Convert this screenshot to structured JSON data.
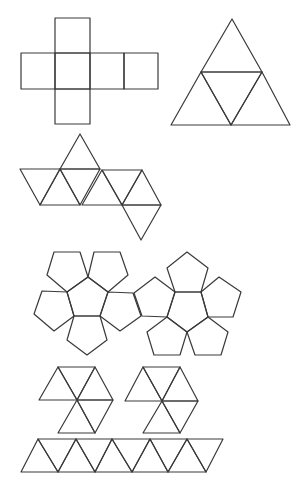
{
  "diagram": {
    "title": "",
    "stroke_color": "#3a3a3a",
    "background": "#ffffff",
    "nets": [
      {
        "id": "cube-net",
        "solid": "cube",
        "faces": 6,
        "polygons": [
          [
            [
              55,
              18
            ],
            [
              90,
              18
            ],
            [
              90,
              53
            ],
            [
              55,
              53
            ]
          ],
          [
            [
              21,
              53
            ],
            [
              55,
              53
            ],
            [
              55,
              89
            ],
            [
              21,
              89
            ]
          ],
          [
            [
              55,
              53
            ],
            [
              90,
              53
            ],
            [
              90,
              89
            ],
            [
              55,
              89
            ]
          ],
          [
            [
              90,
              53
            ],
            [
              124,
              53
            ],
            [
              124,
              89
            ],
            [
              90,
              89
            ]
          ],
          [
            [
              124,
              53
            ],
            [
              158,
              53
            ],
            [
              158,
              89
            ],
            [
              124,
              89
            ]
          ],
          [
            [
              55,
              89
            ],
            [
              90,
              89
            ],
            [
              90,
              124
            ],
            [
              55,
              124
            ]
          ]
        ]
      },
      {
        "id": "tetrahedron-net",
        "solid": "tetrahedron",
        "faces": 4,
        "polygons": [
          [
            [
              232,
              19
            ],
            [
              201,
              72
            ],
            [
              262,
              72
            ]
          ],
          [
            [
              201,
              72
            ],
            [
              171,
              125
            ],
            [
              231,
              125
            ]
          ],
          [
            [
              201,
              72
            ],
            [
              262,
              72
            ],
            [
              231,
              125
            ]
          ],
          [
            [
              262,
              72
            ],
            [
              231,
              125
            ],
            [
              290,
              125
            ]
          ]
        ]
      },
      {
        "id": "octahedron-net",
        "solid": "octahedron",
        "faces": 8,
        "polygons": [
          [
            [
              80,
              134
            ],
            [
              60,
              169
            ],
            [
              100,
              169
            ]
          ],
          [
            [
              20,
              169
            ],
            [
              60,
              169
            ],
            [
              40,
              205
            ]
          ],
          [
            [
              60,
              169
            ],
            [
              40,
              205
            ],
            [
              80,
              205
            ]
          ],
          [
            [
              60,
              169
            ],
            [
              100,
              169
            ],
            [
              80,
              205
            ]
          ],
          [
            [
              102,
              170
            ],
            [
              82,
              205
            ],
            [
              122,
              205
            ]
          ],
          [
            [
              102,
              170
            ],
            [
              142,
              170
            ],
            [
              122,
              205
            ]
          ],
          [
            [
              142,
              170
            ],
            [
              122,
              205
            ],
            [
              161,
              205
            ]
          ],
          [
            [
              122,
              205
            ],
            [
              161,
              205
            ],
            [
              141,
              240
            ]
          ]
        ]
      },
      {
        "id": "dodecahedron-net-left",
        "solid": "dodecahedron (half)",
        "faces": 6,
        "polygons": [
          [
            [
              88,
              277
            ],
            [
              108,
              292
            ],
            [
              100,
              316
            ],
            [
              74,
              316
            ],
            [
              67,
              292
            ]
          ],
          [
            [
              54,
              252
            ],
            [
              80,
              252
            ],
            [
              88,
              277
            ],
            [
              67,
              292
            ],
            [
              47,
              275
            ]
          ],
          [
            [
              94,
              252
            ],
            [
              120,
              252
            ],
            [
              128,
              275
            ],
            [
              108,
              292
            ],
            [
              88,
              277
            ]
          ],
          [
            [
              67,
              292
            ],
            [
              74,
              316
            ],
            [
              54,
              331
            ],
            [
              34,
              314
            ],
            [
              42,
              291
            ]
          ],
          [
            [
              108,
              292
            ],
            [
              133,
              293
            ],
            [
              141,
              316
            ],
            [
              120,
              331
            ],
            [
              100,
              316
            ]
          ],
          [
            [
              74,
              316
            ],
            [
              100,
              316
            ],
            [
              107,
              340
            ],
            [
              87,
              355
            ],
            [
              67,
              340
            ]
          ]
        ]
      },
      {
        "id": "dodecahedron-net-right",
        "solid": "dodecahedron (half)",
        "faces": 6,
        "polygons": [
          [
            [
              175,
              292
            ],
            [
              201,
              292
            ],
            [
              208,
              317
            ],
            [
              187,
              332
            ],
            [
              167,
              317
            ]
          ],
          [
            [
              175,
              292
            ],
            [
              201,
              292
            ],
            [
              208,
              268
            ],
            [
              187,
              252
            ],
            [
              167,
              268
            ]
          ],
          [
            [
              201,
              292
            ],
            [
              208,
              317
            ],
            [
              233,
              317
            ],
            [
              241,
              292
            ],
            [
              219,
              277
            ]
          ],
          [
            [
              175,
              292
            ],
            [
              167,
              317
            ],
            [
              142,
              316
            ],
            [
              134,
              293
            ],
            [
              155,
              277
            ]
          ],
          [
            [
              167,
              317
            ],
            [
              187,
              332
            ],
            [
              180,
              355
            ],
            [
              154,
              355
            ],
            [
              147,
              332
            ]
          ],
          [
            [
              187,
              332
            ],
            [
              208,
              317
            ],
            [
              228,
              332
            ],
            [
              221,
              355
            ],
            [
              195,
              355
            ]
          ]
        ]
      },
      {
        "id": "icosahedron-net-cap-left",
        "solid": "icosahedron (cap)",
        "faces": 5,
        "polygons": [
          [
            [
              58,
              367
            ],
            [
              95,
              367
            ],
            [
              77,
              400
            ]
          ],
          [
            [
              39,
              400
            ],
            [
              58,
              367
            ],
            [
              77,
              400
            ]
          ],
          [
            [
              95,
              367
            ],
            [
              113,
              400
            ],
            [
              77,
              400
            ]
          ],
          [
            [
              77,
              400
            ],
            [
              113,
              400
            ],
            [
              95,
              433
            ]
          ],
          [
            [
              77,
              400
            ],
            [
              95,
              433
            ],
            [
              58,
              433
            ]
          ]
        ]
      },
      {
        "id": "icosahedron-net-cap-right",
        "solid": "icosahedron (cap)",
        "faces": 5,
        "polygons": [
          [
            [
              143,
              367
            ],
            [
              180,
              367
            ],
            [
              162,
              401
            ]
          ],
          [
            [
              125,
              401
            ],
            [
              143,
              367
            ],
            [
              162,
              401
            ]
          ],
          [
            [
              180,
              367
            ],
            [
              198,
              401
            ],
            [
              162,
              401
            ]
          ],
          [
            [
              162,
              401
            ],
            [
              198,
              401
            ],
            [
              180,
              433
            ]
          ],
          [
            [
              162,
              401
            ],
            [
              180,
              433
            ],
            [
              143,
              433
            ]
          ]
        ]
      },
      {
        "id": "icosahedron-net-strip",
        "solid": "icosahedron (band)",
        "faces": 10,
        "polygons": [
          [
            [
              38,
              439
            ],
            [
              21,
              472
            ],
            [
              58,
              472
            ]
          ],
          [
            [
              38,
              439
            ],
            [
              76,
              439
            ],
            [
              58,
              472
            ]
          ],
          [
            [
              76,
              439
            ],
            [
              58,
              472
            ],
            [
              95,
              472
            ]
          ],
          [
            [
              76,
              439
            ],
            [
              112,
              439
            ],
            [
              95,
              472
            ]
          ],
          [
            [
              112,
              439
            ],
            [
              95,
              472
            ],
            [
              132,
              472
            ]
          ],
          [
            [
              112,
              439
            ],
            [
              150,
              439
            ],
            [
              132,
              472
            ]
          ],
          [
            [
              150,
              439
            ],
            [
              132,
              472
            ],
            [
              168,
              472
            ]
          ],
          [
            [
              150,
              439
            ],
            [
              187,
              439
            ],
            [
              168,
              472
            ]
          ],
          [
            [
              187,
              439
            ],
            [
              168,
              472
            ],
            [
              206,
              472
            ]
          ],
          [
            [
              187,
              439
            ],
            [
              223,
              439
            ],
            [
              206,
              472
            ]
          ]
        ]
      }
    ]
  }
}
